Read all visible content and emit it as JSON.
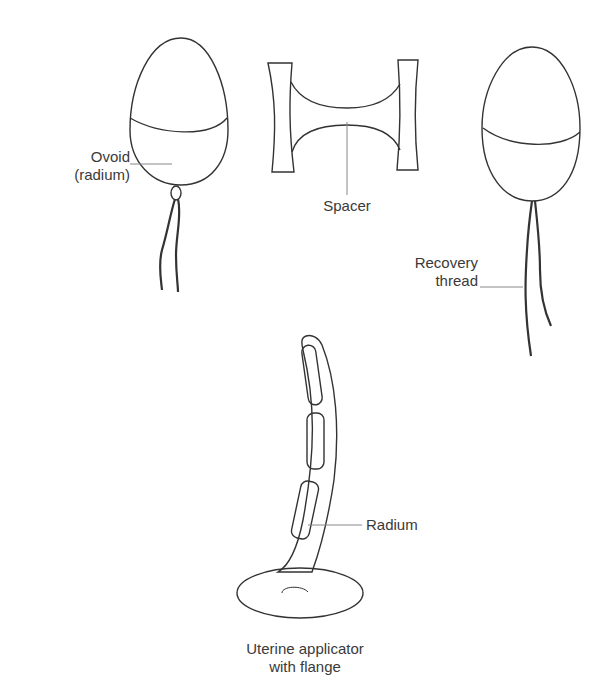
{
  "labels": {
    "ovoid_line1": "Ovoid",
    "ovoid_line2": "(radium)",
    "spacer": "Spacer",
    "recovery_line1": "Recovery",
    "recovery_line2": "thread",
    "radium": "Radium",
    "applicator_line1": "Uterine applicator",
    "applicator_line2": "with flange"
  },
  "colors": {
    "stroke": "#333333",
    "leader": "#888888",
    "background": "#ffffff"
  }
}
